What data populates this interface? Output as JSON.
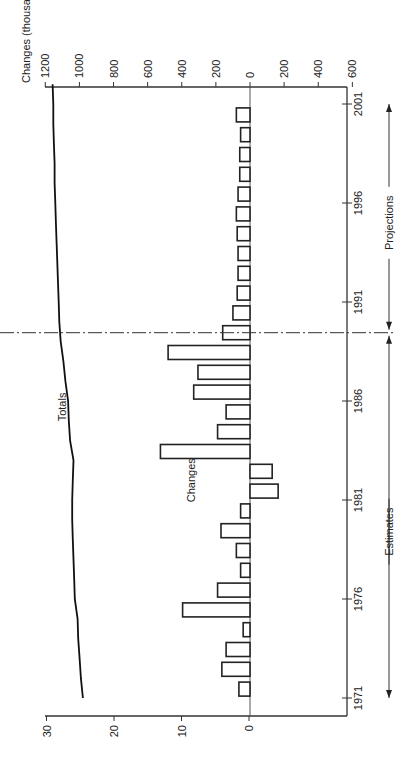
{
  "chart_data": {
    "type": "bar",
    "orientation": "rotated-90-ccw",
    "title": "",
    "xlabel": "",
    "x_tick_labels": [
      "1971",
      "1976",
      "1981",
      "1986",
      "1991",
      "1996",
      "2001"
    ],
    "x_range": [
      1970.1,
      2002
    ],
    "left_axis": {
      "label": "Totals (millions)",
      "ticks": [
        0,
        10,
        20,
        30
      ],
      "range": [
        0,
        30
      ]
    },
    "right_axis": {
      "label": "Changes (thousands)",
      "ticks": [
        1200,
        1000,
        800,
        600,
        400,
        200,
        0,
        200,
        400,
        600
      ],
      "note": "Values above the zero line are increases; below zero are decreases",
      "range": [
        -1200,
        600
      ]
    },
    "divider_year": 1989.5,
    "annotations": {
      "estimates": "Estimates",
      "projections": "Projections",
      "totals_label": "Totals",
      "changes_label": "Changes"
    },
    "series": [
      {
        "name": "Totals",
        "kind": "line",
        "axis": "left",
        "x": [
          1971,
          1972,
          1973,
          1974,
          1975,
          1976,
          1977,
          1978,
          1979,
          1980,
          1981,
          1982,
          1983,
          1984,
          1985,
          1986,
          1987,
          1988,
          1989,
          1990,
          1991,
          1992,
          1993,
          1994,
          1995,
          1996,
          1997,
          1998,
          1999,
          2000,
          2001,
          2002
        ],
        "values": [
          24.6,
          24.9,
          25.1,
          25.3,
          25.4,
          25.8,
          25.9,
          26.0,
          26.1,
          26.2,
          26.2,
          26.1,
          26.0,
          26.5,
          26.7,
          26.8,
          27.2,
          27.5,
          27.9,
          28.1,
          28.2,
          28.3,
          28.4,
          28.5,
          28.6,
          28.7,
          28.8,
          28.8,
          28.9,
          29.0,
          29.0,
          29.1
        ]
      },
      {
        "name": "Changes",
        "kind": "bar",
        "axis": "right",
        "x": [
          1971.5,
          1972.5,
          1973.5,
          1974.5,
          1975.5,
          1976.5,
          1977.5,
          1978.5,
          1979.5,
          1980.5,
          1981.5,
          1982.5,
          1983.5,
          1984.5,
          1985.5,
          1986.5,
          1987.5,
          1988.5,
          1989.5,
          1990.5,
          1991.5,
          1992.5,
          1993.5,
          1994.5,
          1995.5,
          1996.5,
          1997.5,
          1998.5,
          1999.5,
          2000.5,
          2001.5
        ],
        "values": [
          65,
          165,
          140,
          40,
          395,
          190,
          55,
          80,
          170,
          55,
          -165,
          -130,
          525,
          190,
          140,
          330,
          305,
          480,
          160,
          100,
          75,
          70,
          70,
          75,
          80,
          70,
          60,
          60,
          55,
          80,
          0
        ]
      }
    ]
  }
}
